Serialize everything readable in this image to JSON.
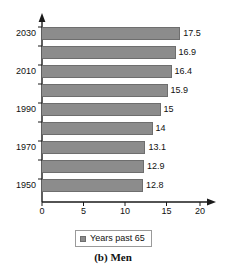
{
  "chart_data": {
    "type": "bar",
    "orientation": "horizontal",
    "title": "",
    "caption": "(b) Men",
    "xlabel": "",
    "ylabel": "",
    "xlim": [
      0,
      20
    ],
    "ylim": [
      0,
      10
    ],
    "grid": false,
    "legend_position": "bottom-center",
    "series": [
      {
        "name": "Years past 65",
        "values": [
          17.5,
          16.9,
          16.4,
          15.9,
          15,
          14,
          13.1,
          12.9,
          12.8
        ]
      }
    ],
    "categories": [
      "2030",
      "",
      "2010",
      "",
      "1990",
      "",
      "1970",
      "",
      "1950"
    ],
    "category_labels_visible": [
      "2030",
      "2010",
      "1990",
      "1970",
      "1950"
    ],
    "bars": [
      {
        "category": "2030",
        "value": 17.5,
        "label": "17.5",
        "year_label": "2030"
      },
      {
        "category": "",
        "value": 16.9,
        "label": "16.9",
        "year_label": ""
      },
      {
        "category": "2010",
        "value": 16.4,
        "label": "16.4",
        "year_label": "2010"
      },
      {
        "category": "",
        "value": 15.9,
        "label": "15.9",
        "year_label": ""
      },
      {
        "category": "1990",
        "value": 15,
        "label": "15",
        "year_label": "1990"
      },
      {
        "category": "",
        "value": 14,
        "label": "14",
        "year_label": ""
      },
      {
        "category": "1970",
        "value": 13.1,
        "label": "13.1",
        "year_label": "1970"
      },
      {
        "category": "",
        "value": 12.9,
        "label": "12.9",
        "year_label": ""
      },
      {
        "category": "1950",
        "value": 12.8,
        "label": "12.8",
        "year_label": "1950"
      }
    ],
    "xticks": [
      0,
      5,
      10,
      15,
      20
    ],
    "xtick_labels": [
      "0",
      "5",
      "10",
      "15",
      "20"
    ],
    "colors": {
      "bar_fill": "#8c8c8c",
      "bar_stroke": "#6e6e6e",
      "axis": "#1a1a1a",
      "text": "#111111",
      "background": "#ffffff",
      "legend_border": "#9a9a9a"
    }
  },
  "legend": {
    "entries": [
      {
        "label": "Years past 65",
        "swatch_color": "#8c8c8c"
      }
    ]
  },
  "caption": {
    "text": "(b) Men"
  },
  "axis": {
    "x_tick_labels": [
      "0",
      "5",
      "10",
      "15",
      "20"
    ],
    "y_category_labels": [
      "2030",
      "2010",
      "1990",
      "1970",
      "1950"
    ]
  }
}
